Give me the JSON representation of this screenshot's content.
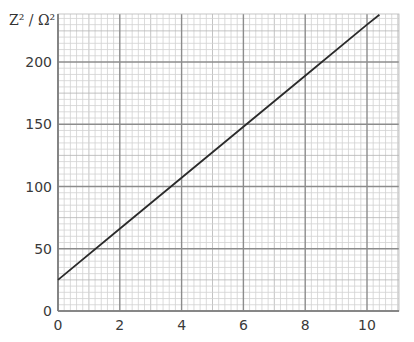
{
  "chart_data": {
    "type": "line",
    "title": "",
    "xlabel": "",
    "ylabel": "Z² / Ω²",
    "xlim": [
      0,
      11
    ],
    "ylim": [
      0,
      240
    ],
    "x_ticks": [
      0,
      2,
      4,
      6,
      8,
      10
    ],
    "y_ticks": [
      0,
      50,
      100,
      150,
      200
    ],
    "x_tick_labels": [
      "0",
      "2",
      "4",
      "6",
      "8",
      "10"
    ],
    "y_tick_labels": [
      "0",
      "50",
      "100",
      "150",
      "200"
    ],
    "grid": true,
    "grid_minor_x": 0.2,
    "grid_minor_y": 5,
    "legend": null,
    "series": [
      {
        "name": "Z²",
        "x": [
          0,
          2,
          4,
          6,
          8,
          10,
          10.4
        ],
        "values": [
          25,
          66,
          107,
          148,
          189,
          230,
          238
        ]
      }
    ]
  },
  "colors": {
    "line": "#2b2b2b",
    "grid_minor": "#d2d2d2",
    "grid_major": "#8c8c8c",
    "axis": "#7a7a7a"
  }
}
